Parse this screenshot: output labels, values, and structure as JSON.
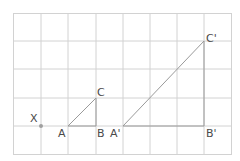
{
  "diagram": {
    "type": "enlargement-grid",
    "grid": {
      "cols": 8,
      "rows": 5,
      "line_color": "#cfcfcf"
    },
    "center": {
      "label": "X"
    },
    "triangle_original": {
      "vertices": [
        "A",
        "B",
        "C"
      ]
    },
    "triangle_image": {
      "vertices": [
        "A'",
        "B'",
        "C'"
      ]
    },
    "labels": {
      "x": "X",
      "a": "A",
      "b": "B",
      "c": "C",
      "a_prime": "A'",
      "b_prime": "B'",
      "c_prime": "C'"
    },
    "colors": {
      "shape": "#9a9a9a",
      "point": "#9a9a9a",
      "text": "#4a4a4a"
    }
  }
}
